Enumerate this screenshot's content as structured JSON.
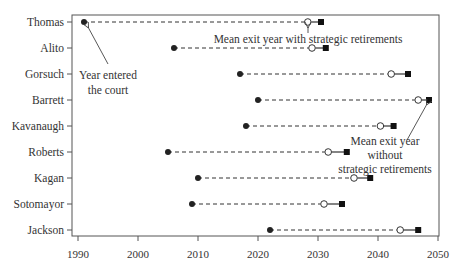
{
  "chart_data": {
    "type": "dumbbell",
    "title": "",
    "xlabel": "",
    "ylabel": "",
    "xlim": [
      1989,
      2050
    ],
    "x_ticks": [
      1990,
      2000,
      2010,
      2020,
      2030,
      2040,
      2050
    ],
    "grid": false,
    "legend": "annotations",
    "categories": [
      "Thomas",
      "Alito",
      "Gorsuch",
      "Barrett",
      "Kavanaugh",
      "Roberts",
      "Kagan",
      "Sotomayor",
      "Jackson"
    ],
    "series": [
      {
        "name": "Year entered the court",
        "marker": "filled-circle",
        "values": [
          1991,
          2006,
          2017,
          2020,
          2018,
          2005,
          2010,
          2009,
          2022
        ]
      },
      {
        "name": "Mean exit year with strategic retirements",
        "marker": "open-circle",
        "values": [
          2028.3,
          2029.0,
          2042.2,
          2046.7,
          2040.4,
          2031.7,
          2036.0,
          2031.0,
          2043.7
        ]
      },
      {
        "name": "Mean exit year without strategic retirements",
        "marker": "filled-square",
        "values": [
          2030.5,
          2031.3,
          2045.0,
          2048.5,
          2042.6,
          2034.8,
          2038.7,
          2034.0,
          2046.7
        ]
      }
    ],
    "annotations": [
      {
        "text": [
          "Year entered",
          "the court"
        ],
        "points_to": "Thomas entered"
      },
      {
        "text": [
          "Mean exit year with strategic retirements"
        ],
        "points_to": "Thomas open circle"
      },
      {
        "text": [
          "Mean exit year",
          "without",
          "strategic retirements"
        ],
        "points_to": "Barrett square"
      }
    ]
  }
}
